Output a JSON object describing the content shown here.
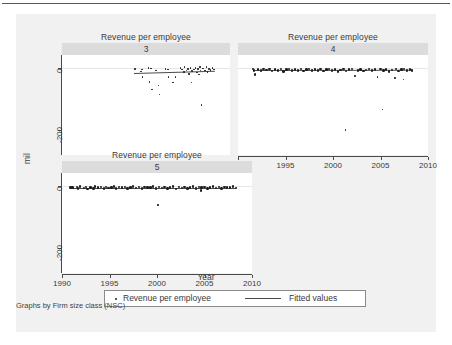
{
  "figure": {
    "axis_title_y": "mil",
    "axis_title_x": "Year",
    "footnote": "Graphs by Firm size class (NSC)",
    "background": "#f1f1f1",
    "panel_strip_color": "#dcdcdc",
    "marker_color": "#1d1d1d",
    "line_color": "#4a4a4a"
  },
  "legend": {
    "entries": [
      {
        "label": "Revenue per employee",
        "marker": "dot"
      },
      {
        "label": "Fitted values",
        "marker": "line"
      }
    ]
  },
  "chart_data": {
    "type": "scatter",
    "title": "Revenue per employee",
    "xlabel": "Year",
    "ylabel": "mil",
    "xlim": [
      1990,
      2010
    ],
    "ylim": [
      -280,
      40
    ],
    "xticks": [
      1990,
      1995,
      2000,
      2005,
      2010
    ],
    "xticklabels": [
      "1990",
      "1995",
      "2000",
      "2005",
      "2010"
    ],
    "yticks": [
      0,
      -200
    ],
    "yticklabels": [
      "0",
      "-200"
    ],
    "grid": false,
    "legend_position": "bottom-center",
    "facet_by": "Firm size class (NSC)",
    "panels": [
      {
        "label": "3",
        "title": "Revenue per employee",
        "show_xaxis_labels": false,
        "show_yaxis_labels": true,
        "fit_line": {
          "x0": 1998.6,
          "y0": -16,
          "x1": 2008.2,
          "y1": -9
        },
        "points": [
          {
            "x": 1998.7,
            "y": -4
          },
          {
            "x": 1999.4,
            "y": -13
          },
          {
            "x": 1999.5,
            "y": -6
          },
          {
            "x": 1999.6,
            "y": -30
          },
          {
            "x": 2000.3,
            "y": -2
          },
          {
            "x": 2000.6,
            "y": -3
          },
          {
            "x": 2000.4,
            "y": -46
          },
          {
            "x": 2000.7,
            "y": -70
          },
          {
            "x": 2001.2,
            "y": -10
          },
          {
            "x": 2001.5,
            "y": -57
          },
          {
            "x": 2001.6,
            "y": -87
          },
          {
            "x": 2002.3,
            "y": -4
          },
          {
            "x": 2002.6,
            "y": -6
          },
          {
            "x": 2002.7,
            "y": -30
          },
          {
            "x": 2003.2,
            "y": -48
          },
          {
            "x": 2003.5,
            "y": -31
          },
          {
            "x": 2004.1,
            "y": -2
          },
          {
            "x": 2004.3,
            "y": -6
          },
          {
            "x": 2004.5,
            "y": -14
          },
          {
            "x": 2004.6,
            "y": 2
          },
          {
            "x": 2004.8,
            "y": -9
          },
          {
            "x": 2005.0,
            "y": -5
          },
          {
            "x": 2005.1,
            "y": -20
          },
          {
            "x": 2005.3,
            "y": -2
          },
          {
            "x": 2005.4,
            "y": -48
          },
          {
            "x": 2005.5,
            "y": -12
          },
          {
            "x": 2005.7,
            "y": -7
          },
          {
            "x": 2005.9,
            "y": -1
          },
          {
            "x": 2006.1,
            "y": -16
          },
          {
            "x": 2006.2,
            "y": -5
          },
          {
            "x": 2006.3,
            "y": -22
          },
          {
            "x": 2006.4,
            "y": 1
          },
          {
            "x": 2006.5,
            "y": -10
          },
          {
            "x": 2006.6,
            "y": -120
          },
          {
            "x": 2006.8,
            "y": -3
          },
          {
            "x": 2007.0,
            "y": -9
          },
          {
            "x": 2007.2,
            "y": 2
          },
          {
            "x": 2007.3,
            "y": -14
          },
          {
            "x": 2007.5,
            "y": -4
          },
          {
            "x": 2007.7,
            "y": -8
          },
          {
            "x": 2007.9,
            "y": -2
          },
          {
            "x": 2008.1,
            "y": -6
          }
        ]
      },
      {
        "label": "4",
        "title": "Revenue per employee",
        "show_xaxis_labels": true,
        "show_yaxis_labels": false,
        "fit_line": {
          "x0": 1991.6,
          "y0": -8,
          "x1": 2008.3,
          "y1": -7
        },
        "points": [
          {
            "x": 1991.6,
            "y": -4
          },
          {
            "x": 1991.7,
            "y": -10
          },
          {
            "x": 1991.8,
            "y": -22
          },
          {
            "x": 1992.1,
            "y": -6
          },
          {
            "x": 1992.4,
            "y": -9
          },
          {
            "x": 1992.7,
            "y": -5
          },
          {
            "x": 1993.0,
            "y": -8
          },
          {
            "x": 1993.3,
            "y": -4
          },
          {
            "x": 1993.6,
            "y": -11
          },
          {
            "x": 1993.9,
            "y": -6
          },
          {
            "x": 1994.2,
            "y": -9
          },
          {
            "x": 1994.5,
            "y": -5
          },
          {
            "x": 1994.8,
            "y": -13
          },
          {
            "x": 1995.1,
            "y": -7
          },
          {
            "x": 1995.4,
            "y": -4
          },
          {
            "x": 1995.7,
            "y": -10
          },
          {
            "x": 1996.0,
            "y": -6
          },
          {
            "x": 1996.3,
            "y": -9
          },
          {
            "x": 1996.6,
            "y": -5
          },
          {
            "x": 1996.9,
            "y": -12
          },
          {
            "x": 1997.2,
            "y": -7
          },
          {
            "x": 1997.5,
            "y": -4
          },
          {
            "x": 1997.8,
            "y": -10
          },
          {
            "x": 1998.1,
            "y": -6
          },
          {
            "x": 1998.4,
            "y": -9
          },
          {
            "x": 1998.7,
            "y": -5
          },
          {
            "x": 1999.0,
            "y": -11
          },
          {
            "x": 1999.3,
            "y": -7
          },
          {
            "x": 1999.6,
            "y": -4
          },
          {
            "x": 1999.9,
            "y": -10
          },
          {
            "x": 2000.2,
            "y": -6
          },
          {
            "x": 2000.5,
            "y": -13
          },
          {
            "x": 2000.8,
            "y": -8
          },
          {
            "x": 2001.1,
            "y": -5
          },
          {
            "x": 2001.3,
            "y": -200
          },
          {
            "x": 2001.4,
            "y": -11
          },
          {
            "x": 2001.7,
            "y": -7
          },
          {
            "x": 2002.0,
            "y": -4
          },
          {
            "x": 2002.3,
            "y": -27
          },
          {
            "x": 2002.6,
            "y": -9
          },
          {
            "x": 2002.9,
            "y": -6
          },
          {
            "x": 2003.2,
            "y": -12
          },
          {
            "x": 2003.5,
            "y": -8
          },
          {
            "x": 2003.8,
            "y": -5
          },
          {
            "x": 2004.1,
            "y": -10
          },
          {
            "x": 2004.4,
            "y": -7
          },
          {
            "x": 2004.7,
            "y": -30
          },
          {
            "x": 2005.0,
            "y": -4
          },
          {
            "x": 2005.2,
            "y": -135
          },
          {
            "x": 2005.3,
            "y": -9
          },
          {
            "x": 2005.6,
            "y": -6
          },
          {
            "x": 2005.9,
            "y": -13
          },
          {
            "x": 2006.2,
            "y": -8
          },
          {
            "x": 2006.5,
            "y": -34
          },
          {
            "x": 2006.6,
            "y": -5
          },
          {
            "x": 2006.9,
            "y": -11
          },
          {
            "x": 2007.2,
            "y": -7
          },
          {
            "x": 2007.4,
            "y": -38
          },
          {
            "x": 2007.5,
            "y": -4
          },
          {
            "x": 2007.8,
            "y": -10
          },
          {
            "x": 2008.1,
            "y": -6
          },
          {
            "x": 2008.3,
            "y": -9
          }
        ]
      },
      {
        "label": "5",
        "title": "Revenue per employee",
        "show_xaxis_labels": true,
        "show_yaxis_labels": true,
        "fit_line": {
          "x0": 1990.9,
          "y0": -7,
          "x1": 2008.3,
          "y1": -7
        },
        "points": [
          {
            "x": 1990.9,
            "y": -6
          },
          {
            "x": 1991.1,
            "y": -7
          },
          {
            "x": 1991.6,
            "y": -5
          },
          {
            "x": 1991.7,
            "y": -10
          },
          {
            "x": 1991.9,
            "y": -3
          },
          {
            "x": 1992.3,
            "y": -8
          },
          {
            "x": 1992.5,
            "y": -4
          },
          {
            "x": 1992.7,
            "y": -11
          },
          {
            "x": 1993.0,
            "y": -6
          },
          {
            "x": 1993.3,
            "y": -9
          },
          {
            "x": 1993.5,
            "y": -3
          },
          {
            "x": 1993.8,
            "y": -7
          },
          {
            "x": 1994.1,
            "y": -5
          },
          {
            "x": 1994.4,
            "y": -10
          },
          {
            "x": 1994.6,
            "y": -4
          },
          {
            "x": 1994.9,
            "y": -8
          },
          {
            "x": 1995.2,
            "y": -6
          },
          {
            "x": 1995.5,
            "y": -3
          },
          {
            "x": 1995.7,
            "y": -9
          },
          {
            "x": 1996.0,
            "y": -5
          },
          {
            "x": 1996.3,
            "y": -7
          },
          {
            "x": 1996.6,
            "y": -4
          },
          {
            "x": 1996.9,
            "y": -10
          },
          {
            "x": 1997.2,
            "y": -6
          },
          {
            "x": 1997.5,
            "y": -3
          },
          {
            "x": 1997.8,
            "y": -8
          },
          {
            "x": 1998.1,
            "y": -5
          },
          {
            "x": 1998.4,
            "y": -9
          },
          {
            "x": 1998.7,
            "y": -4
          },
          {
            "x": 1999.0,
            "y": -7
          },
          {
            "x": 1999.3,
            "y": -6
          },
          {
            "x": 1999.6,
            "y": -3
          },
          {
            "x": 1999.9,
            "y": -10
          },
          {
            "x": 2000.1,
            "y": -62
          },
          {
            "x": 2000.2,
            "y": -5
          },
          {
            "x": 2000.5,
            "y": -8
          },
          {
            "x": 2000.8,
            "y": -4
          },
          {
            "x": 2001.1,
            "y": -9
          },
          {
            "x": 2001.4,
            "y": -6
          },
          {
            "x": 2001.7,
            "y": -3
          },
          {
            "x": 2002.0,
            "y": -11
          },
          {
            "x": 2002.3,
            "y": -5
          },
          {
            "x": 2002.6,
            "y": -8
          },
          {
            "x": 2002.9,
            "y": -4
          },
          {
            "x": 2003.2,
            "y": -10
          },
          {
            "x": 2003.5,
            "y": -6
          },
          {
            "x": 2003.8,
            "y": -3
          },
          {
            "x": 2004.1,
            "y": -9
          },
          {
            "x": 2004.4,
            "y": -5
          },
          {
            "x": 2004.6,
            "y": -16
          },
          {
            "x": 2004.7,
            "y": -7
          },
          {
            "x": 2005.0,
            "y": -4
          },
          {
            "x": 2005.3,
            "y": -10
          },
          {
            "x": 2005.6,
            "y": -6
          },
          {
            "x": 2005.9,
            "y": -3
          },
          {
            "x": 2006.2,
            "y": -8
          },
          {
            "x": 2006.5,
            "y": -5
          },
          {
            "x": 2006.8,
            "y": -9
          },
          {
            "x": 2007.1,
            "y": -4
          },
          {
            "x": 2007.4,
            "y": -7
          },
          {
            "x": 2007.7,
            "y": -6
          },
          {
            "x": 2008.0,
            "y": -3
          },
          {
            "x": 2008.3,
            "y": -8
          }
        ]
      }
    ]
  }
}
